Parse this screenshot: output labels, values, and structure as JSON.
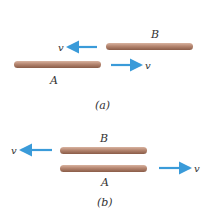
{
  "colors": {
    "rod_light": "#d9b3a0",
    "rod_mid": "#b58670",
    "rod_dark": "#8a5c48",
    "arrow": "#3a9bd9",
    "text": "#333333"
  },
  "panels": [
    {
      "caption": "(a)",
      "rods": [
        {
          "label": "B",
          "velocity_label": "v",
          "direction": "left"
        },
        {
          "label": "A",
          "velocity_label": "v",
          "direction": "right"
        }
      ]
    },
    {
      "caption": "(b)",
      "rods": [
        {
          "label": "B",
          "velocity_label": "v",
          "direction": "left"
        },
        {
          "label": "A",
          "velocity_label": "v",
          "direction": "right"
        }
      ]
    }
  ]
}
